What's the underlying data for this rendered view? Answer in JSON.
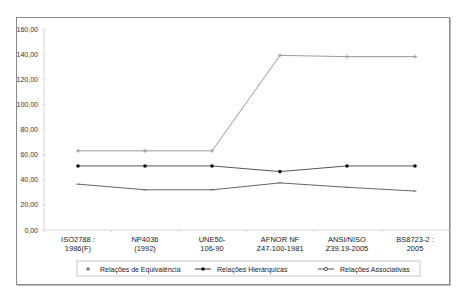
{
  "chart_data": {
    "type": "line",
    "title": "",
    "xlabel": "",
    "ylabel": "",
    "ylim": [
      0,
      160
    ],
    "yticks": [
      "0,00",
      "20,00",
      "40,00",
      "60,00",
      "80,00",
      "100,00",
      "120,00",
      "140,00",
      "160,00"
    ],
    "grid": false,
    "legend_position": "bottom",
    "categories": [
      [
        "ISO2788 :",
        "1986(F)"
      ],
      [
        "NP4036",
        "(1992)"
      ],
      [
        "UNE50-",
        "106-90"
      ],
      [
        "AFNOR NF",
        "Z47-100-1981"
      ],
      [
        "ANSI/NISO",
        "Z39.19-2005"
      ],
      [
        "BS8723-2 :",
        "2005"
      ]
    ],
    "series": [
      {
        "name": "Relações de Equivalência",
        "marker": "plus",
        "color": "#9a9a9a",
        "values": [
          63,
          63,
          63,
          139,
          138,
          138
        ]
      },
      {
        "name": "Relações Hierárquicas",
        "marker": "dot",
        "color": "#555555",
        "values": [
          51,
          51,
          51,
          46.5,
          51,
          51
        ]
      },
      {
        "name": "Relações Associativas",
        "marker": "dash",
        "color": "#666666",
        "values": [
          36.5,
          32,
          32,
          37.5,
          34,
          31
        ]
      }
    ]
  }
}
